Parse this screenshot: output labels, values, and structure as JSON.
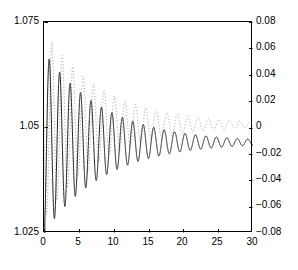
{
  "figure": {
    "background": "#ffffff",
    "frame_color": "#000000"
  },
  "axes": {
    "left": {
      "symbol": "δ",
      "ticks": [
        "1.075",
        "1.05",
        "1.025"
      ],
      "range": [
        1.025,
        1.075
      ]
    },
    "right": {
      "symbol": "δ′",
      "ticks": [
        "0.08",
        "0.06",
        "0.04",
        "0.02",
        "0",
        "−0.02",
        "−0.04",
        "−0.06",
        "−0.08"
      ],
      "range": [
        -0.08,
        0.08
      ]
    },
    "bottom": {
      "title": "T",
      "ticks": [
        "0",
        "5",
        "10",
        "15",
        "20",
        "25",
        "30"
      ],
      "range": [
        0,
        30
      ]
    }
  },
  "chart_data": {
    "type": "line",
    "title": "",
    "xlabel": "T",
    "ylabel": "δ",
    "y2label": "δ′",
    "xlim": [
      0,
      30
    ],
    "ylim": [
      1.025,
      1.075
    ],
    "y2lim": [
      -0.08,
      0.08
    ],
    "grid": false,
    "legend": false,
    "xticks": [
      0,
      5,
      10,
      15,
      20,
      25,
      30
    ],
    "yticks": [
      1.025,
      1.05,
      1.075
    ],
    "y2ticks": [
      -0.08,
      -0.06,
      -0.04,
      -0.02,
      0,
      0.02,
      0.04,
      0.06,
      0.08
    ],
    "series": [
      {
        "name": "δ",
        "axis": "left",
        "style": "solid",
        "color": "#1a1a1a",
        "width": 1.0,
        "model": {
          "kind": "damped_oscillation",
          "offset": 1.0465,
          "amplitude": 0.0215,
          "decay": 0.115,
          "period": 1.5,
          "phase_deg": 180,
          "start_value": 1.025,
          "start_x": 0.0,
          "ramp_x": 0.12
        },
        "notes": "Solid curve on left axis. Rises from 1.025 at T=0, first peak ~1.0555 near T=0.8, decays to ~1.0465 by T=30."
      },
      {
        "name": "δ′",
        "axis": "right",
        "style": "dotted",
        "color": "#9a9a9a",
        "width": 1.0,
        "model": {
          "kind": "damped_oscillation",
          "offset": 0.0022,
          "amplitude": 0.0715,
          "decay": 0.118,
          "period": 1.5,
          "phase_deg": 90,
          "start_value": 0.0,
          "start_x": 0.0,
          "ramp_x": 0.0
        },
        "notes": "Dotted grey curve on right axis. First peak ~0.072 near T=0.25, first trough ~−0.065 near T=1.0, decays toward ~0.003 by T=30."
      }
    ]
  }
}
